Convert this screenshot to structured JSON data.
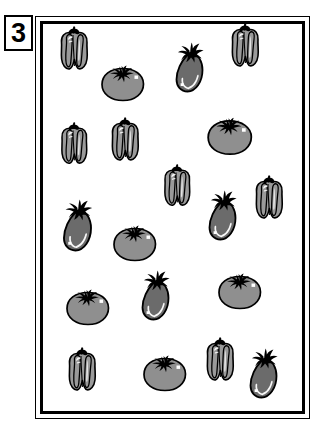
{
  "page": {
    "badge_number": "3",
    "background_color": "#ffffff",
    "frame_border_color": "#000000"
  },
  "palette": {
    "pepper_fill": "#9a9a9a",
    "pepper_shade": "#8a8a8a",
    "tomato_fill": "#8f8f8f",
    "eggplant_fill": "#6b6b6b",
    "outline": "#000000",
    "highlight": "#ffffff"
  },
  "legend": {
    "pepper_label": "bell pepper",
    "tomato_label": "tomato",
    "eggplant_label": "eggplant"
  },
  "counts": {
    "pepper": 7,
    "tomato": 7,
    "eggplant": 6,
    "total": 20
  },
  "items": [
    {
      "type": "pepper",
      "x": 55,
      "y": 25,
      "scale": 1.0,
      "rot": 0
    },
    {
      "type": "tomato",
      "x": 98,
      "y": 62,
      "scale": 1.0,
      "rot": 0
    },
    {
      "type": "eggplant",
      "x": 172,
      "y": 38,
      "scale": 1.0,
      "rot": 0
    },
    {
      "type": "pepper",
      "x": 226,
      "y": 22,
      "scale": 1.0,
      "rot": 0
    },
    {
      "type": "pepper",
      "x": 55,
      "y": 120,
      "scale": 0.96,
      "rot": 0
    },
    {
      "type": "pepper",
      "x": 106,
      "y": 116,
      "scale": 1.0,
      "rot": 0
    },
    {
      "type": "tomato",
      "x": 205,
      "y": 115,
      "scale": 1.04,
      "rot": 0
    },
    {
      "type": "pepper",
      "x": 158,
      "y": 162,
      "scale": 0.96,
      "rot": 0
    },
    {
      "type": "eggplant",
      "x": 205,
      "y": 186,
      "scale": 1.0,
      "rot": 0
    },
    {
      "type": "pepper",
      "x": 250,
      "y": 174,
      "scale": 1.0,
      "rot": 0
    },
    {
      "type": "eggplant",
      "x": 60,
      "y": 196,
      "scale": 1.04,
      "rot": 0
    },
    {
      "type": "tomato",
      "x": 110,
      "y": 222,
      "scale": 1.0,
      "rot": 0
    },
    {
      "type": "tomato",
      "x": 63,
      "y": 286,
      "scale": 1.0,
      "rot": 0
    },
    {
      "type": "eggplant",
      "x": 138,
      "y": 266,
      "scale": 1.0,
      "rot": 0
    },
    {
      "type": "tomato",
      "x": 215,
      "y": 270,
      "scale": 1.0,
      "rot": 0
    },
    {
      "type": "pepper",
      "x": 63,
      "y": 346,
      "scale": 1.0,
      "rot": 0
    },
    {
      "type": "tomato",
      "x": 140,
      "y": 352,
      "scale": 1.0,
      "rot": 0
    },
    {
      "type": "pepper",
      "x": 201,
      "y": 336,
      "scale": 1.0,
      "rot": 0
    },
    {
      "type": "eggplant",
      "x": 246,
      "y": 344,
      "scale": 1.0,
      "rot": 0
    }
  ]
}
